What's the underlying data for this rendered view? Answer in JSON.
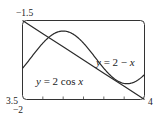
{
  "chart_data": {
    "type": "line",
    "title": "",
    "xlabel": "",
    "ylabel": "",
    "xlim": [
      -2,
      4
    ],
    "ylim": [
      -1.5,
      3.5
    ],
    "grid": false,
    "legend": "inline labels",
    "corner_labels": {
      "top_left": "−1.5",
      "bottom_left": "3.5",
      "x_min": "−2",
      "x_max": "4"
    },
    "x_ticks": [
      -1,
      0,
      1,
      2,
      3
    ],
    "series": [
      {
        "name": "y = 2 − x",
        "label_var": "y",
        "label_eq": " = 2 − ",
        "label_tail": "x",
        "x": [
          -2,
          -1,
          0,
          1,
          2,
          3,
          4
        ],
        "values": [
          4,
          3,
          2,
          1,
          0,
          -1,
          -2
        ]
      },
      {
        "name": "y = 2cos x",
        "label_var": "y",
        "label_eq": " = 2 cos ",
        "label_tail": "x",
        "x": [
          -2,
          -1.5,
          -1,
          -0.5,
          0,
          0.5,
          1,
          1.5,
          2,
          2.5,
          3,
          3.5,
          4
        ],
        "values": [
          -0.83,
          0.14,
          1.08,
          1.76,
          2.0,
          1.76,
          1.08,
          0.14,
          -0.83,
          -1.6,
          -1.98,
          -1.87,
          -1.31
        ]
      }
    ]
  }
}
